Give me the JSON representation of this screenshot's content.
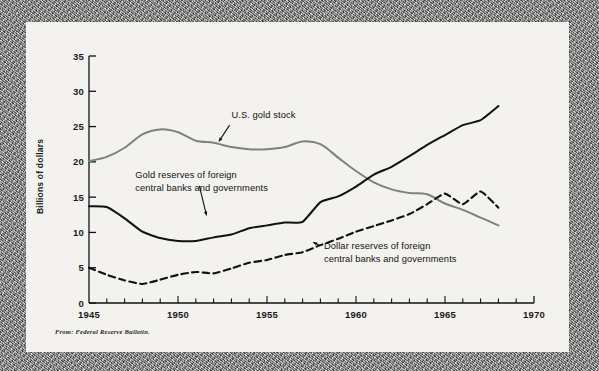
{
  "figure": {
    "background_color": "#f3f2ef",
    "surface_color": "#8f8f8f",
    "source_note": "From: Federal Reserve Bulletin.",
    "ylabel": "Billions of dollars"
  },
  "chart_data": {
    "type": "line",
    "title": "",
    "subtitle": "",
    "xlabel": "",
    "ylabel": "Billions of dollars",
    "xlim": [
      1945,
      1970
    ],
    "ylim": [
      0,
      35
    ],
    "yticks": [
      0,
      5,
      10,
      15,
      20,
      25,
      30,
      35
    ],
    "ytick_labels": [
      "0",
      "5",
      "10",
      "15",
      "20",
      "25",
      "30",
      "35"
    ],
    "xticks": [
      1945,
      1950,
      1955,
      1960,
      1965,
      1970
    ],
    "xtick_labels": [
      "1945",
      "1950",
      "1955",
      "1960",
      "1965",
      "1970"
    ],
    "minor_xtick_interval": 1,
    "grid": false,
    "legend_position": "inline-annotations",
    "x": [
      1945,
      1946,
      1947,
      1948,
      1949,
      1950,
      1951,
      1952,
      1953,
      1954,
      1955,
      1956,
      1957,
      1958,
      1959,
      1960,
      1961,
      1962,
      1963,
      1964,
      1965,
      1966,
      1967,
      1968
    ],
    "series": [
      {
        "name": "U.S. gold stock",
        "color": "#808080",
        "style": "solid",
        "label": "U.S. gold stock",
        "label_x": 1953.0,
        "label_y": 26.2,
        "values": [
          20.1,
          20.7,
          22.0,
          23.9,
          24.6,
          24.2,
          23.0,
          22.7,
          22.1,
          21.8,
          21.8,
          22.1,
          22.9,
          22.5,
          20.6,
          18.7,
          17.1,
          16.1,
          15.6,
          15.4,
          14.1,
          13.2,
          12.1,
          11.0
        ]
      },
      {
        "name": "Gold reserves of foreign central banks and governments",
        "color": "#111111",
        "style": "solid",
        "label": "Gold reserves of foreign\ncentral banks and governments",
        "label_line1": "Gold reserves of foreign",
        "label_line2": "central banks and governments",
        "label_x": 1947.6,
        "label_y": 17.7,
        "values": [
          13.7,
          13.6,
          12.0,
          10.1,
          9.2,
          8.8,
          8.8,
          9.3,
          9.7,
          10.6,
          11.0,
          11.4,
          11.5,
          14.3,
          15.1,
          16.5,
          18.2,
          19.3,
          20.8,
          22.4,
          23.8,
          25.2,
          25.9,
          27.9
        ]
      },
      {
        "name": "Dollar reserves of foreign central banks and governments",
        "color": "#111111",
        "style": "dashed",
        "label": "Dollar reserves of foreign\ncentral banks and governments",
        "label_line1": "Dollar reserves of foreign",
        "label_line2": "central banks and governments",
        "label_x": 1958.2,
        "label_y": 7.6,
        "values": [
          5.0,
          4.0,
          3.2,
          2.7,
          3.3,
          4.0,
          4.4,
          4.2,
          4.9,
          5.7,
          6.1,
          6.8,
          7.2,
          8.2,
          9.1,
          10.1,
          10.9,
          11.7,
          12.6,
          14.0,
          15.5,
          14.0,
          15.8,
          13.5
        ]
      }
    ],
    "annotations": [
      {
        "name": "us-gold-stock-pointer",
        "from_x": 1952.9,
        "from_y": 25.2,
        "to_x": 1952.3,
        "to_y": 22.9
      },
      {
        "name": "gold-reserves-foreign-pointer",
        "from_x": 1951.2,
        "from_y": 16.6,
        "to_x": 1951.6,
        "to_y": 12.4
      },
      {
        "name": "dollar-reserves-foreign-pointer",
        "from_x": 1958.0,
        "from_y": 8.1,
        "to_x": 1957.6,
        "to_y": 8.6
      }
    ]
  }
}
